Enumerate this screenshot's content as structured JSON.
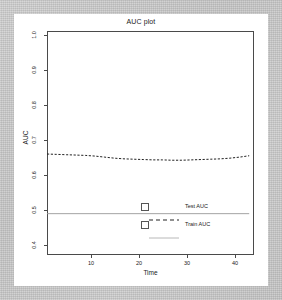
{
  "chart_data": {
    "type": "line",
    "title": "AUC plot",
    "xlabel": "Time",
    "ylabel": "AUC",
    "xlim": [
      1,
      44
    ],
    "ylim": [
      0.38,
      1.03
    ],
    "xticks": [
      "10",
      "20",
      "30",
      "40"
    ],
    "xtick_values": [
      10,
      20,
      30,
      40
    ],
    "yticks": [
      "1.0",
      "0.9",
      "0.8",
      "0.7",
      "0.6",
      "0.5",
      "0.4"
    ],
    "ytick_values": [
      1.0,
      0.9,
      0.8,
      0.7,
      0.6,
      0.5,
      0.4
    ],
    "grid": false,
    "legend_position": "bottom-right",
    "series": [
      {
        "name": "Test AUC",
        "style": "dashed",
        "color": "#222222",
        "x": [
          1,
          3,
          5,
          7,
          9,
          11,
          13,
          15,
          17,
          19,
          21,
          23,
          25,
          27,
          29,
          31,
          33,
          35,
          37,
          39,
          41,
          43
        ],
        "values": [
          0.673,
          0.672,
          0.671,
          0.67,
          0.669,
          0.667,
          0.664,
          0.661,
          0.659,
          0.658,
          0.657,
          0.656,
          0.656,
          0.655,
          0.655,
          0.656,
          0.657,
          0.658,
          0.659,
          0.661,
          0.664,
          0.668
        ]
      },
      {
        "name": "Train AUC",
        "style": "solid",
        "color": "#999999",
        "x": [
          1,
          43
        ],
        "values": [
          0.5,
          0.5
        ]
      }
    ]
  },
  "legend": {
    "entries": [
      {
        "label": "Test AUC",
        "style": "dashed"
      },
      {
        "label": "Train AUC",
        "style": "solid"
      }
    ]
  }
}
